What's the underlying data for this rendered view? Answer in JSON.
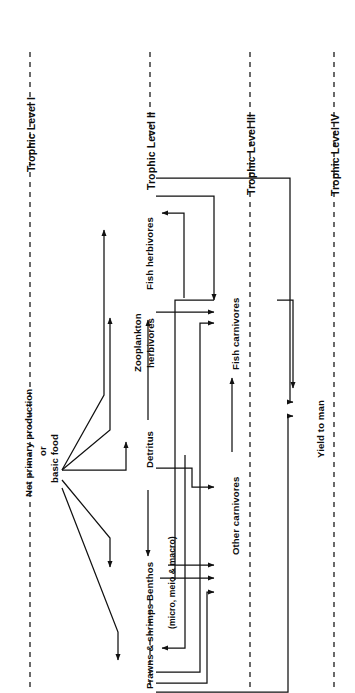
{
  "figure": {
    "kind": "food-web / energy-flow diagram",
    "orientation": "rotated 90 degrees counter-clockwise (text reads bottom-to-top)",
    "background_color": "#ffffff",
    "line_color": "#111111",
    "text_color": "#0d0d0d"
  },
  "trophic_levels": [
    {
      "id": "level-1",
      "label": "Trophic Level I"
    },
    {
      "id": "level-2",
      "label": "Trophic Level II"
    },
    {
      "id": "level-3",
      "label": "Trophic Level III"
    },
    {
      "id": "level-4",
      "label": "Trophic Level IV"
    }
  ],
  "nodes": {
    "source": {
      "id": "net-primary-production",
      "line1": "Net primary production",
      "line2": "or",
      "line3": "basic food"
    },
    "fish_herbivores": {
      "id": "fish-herbivores",
      "label": "Fish herbivores"
    },
    "zooplankton_herbivores": {
      "id": "zooplankton-herbivores",
      "line1": "Zooplankton",
      "line2": "herbivores"
    },
    "detritus": {
      "id": "detritus",
      "label": "Detritus"
    },
    "benthos": {
      "id": "benthos",
      "label": "Benthos"
    },
    "benthos_note": {
      "id": "benthos-note",
      "label": "(micro, meio & macro)"
    },
    "prawns_shrimps": {
      "id": "prawns-shrimps",
      "label": "Prawns & shrimps"
    },
    "fish_carnivores": {
      "id": "fish-carnivores",
      "label": "Fish carnivores"
    },
    "other_carnivores": {
      "id": "other-carnivores",
      "label": "Other carnivores"
    },
    "yield_to_man": {
      "id": "yield-to-man",
      "label": "Yield to man"
    }
  },
  "flows": [
    {
      "from": "net-primary-production",
      "to": "fish-herbivores"
    },
    {
      "from": "net-primary-production",
      "to": "zooplankton-herbivores"
    },
    {
      "from": "net-primary-production",
      "to": "detritus"
    },
    {
      "from": "net-primary-production",
      "to": "benthos"
    },
    {
      "from": "net-primary-production",
      "to": "prawns-shrimps"
    },
    {
      "from": "detritus",
      "to": "zooplankton-herbivores"
    },
    {
      "from": "detritus",
      "to": "benthos"
    },
    {
      "from": "detritus",
      "to": "prawns-shrimps"
    },
    {
      "from": "zooplankton-herbivores",
      "to": "fish-herbivores"
    },
    {
      "from": "zooplankton-herbivores",
      "to": "fish-carnivores"
    },
    {
      "from": "fish-herbivores",
      "to": "fish-carnivores"
    },
    {
      "from": "benthos",
      "to": "fish-carnivores"
    },
    {
      "from": "benthos",
      "to": "other-carnivores"
    },
    {
      "from": "prawns-shrimps",
      "to": "fish-carnivores"
    },
    {
      "from": "prawns-shrimps",
      "to": "other-carnivores"
    },
    {
      "from": "detritus",
      "to": "other-carnivores"
    },
    {
      "from": "other-carnivores",
      "to": "fish-carnivores"
    },
    {
      "from": "fish-carnivores",
      "to": "yield-to-man"
    },
    {
      "from": "fish-herbivores",
      "to": "yield-to-man"
    },
    {
      "from": "prawns-shrimps",
      "to": "yield-to-man"
    }
  ]
}
